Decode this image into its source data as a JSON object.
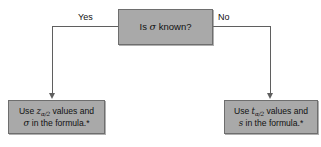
{
  "figure": {
    "type": "flowchart",
    "background_color": "#ffffff",
    "node_fill_color": "#a9a9a9",
    "node_border_color": "#6e6e6e",
    "connector_color": "#5f5f5f",
    "text_color": "#111111"
  },
  "decision": {
    "name": "is-sigma-known",
    "text_prefix": "Is ",
    "symbol": "σ",
    "text_suffix": " known?"
  },
  "branches": {
    "yes_label": "Yes",
    "no_label": "No"
  },
  "outcome_left": {
    "name": "use-z-values",
    "line1_prefix": "Use ",
    "line1_var": "z",
    "line1_sub": "α/2",
    "line1_suffix": " values and",
    "line2_symbol": "σ",
    "line2_suffix": " in the formula.*"
  },
  "outcome_right": {
    "name": "use-t-values",
    "line1_prefix": "Use ",
    "line1_var": "t",
    "line1_sub": "α/2",
    "line1_suffix": " values and",
    "line2_symbol": "s",
    "line2_suffix": " in the formula.*"
  },
  "caption": {
    "fragment": " "
  }
}
